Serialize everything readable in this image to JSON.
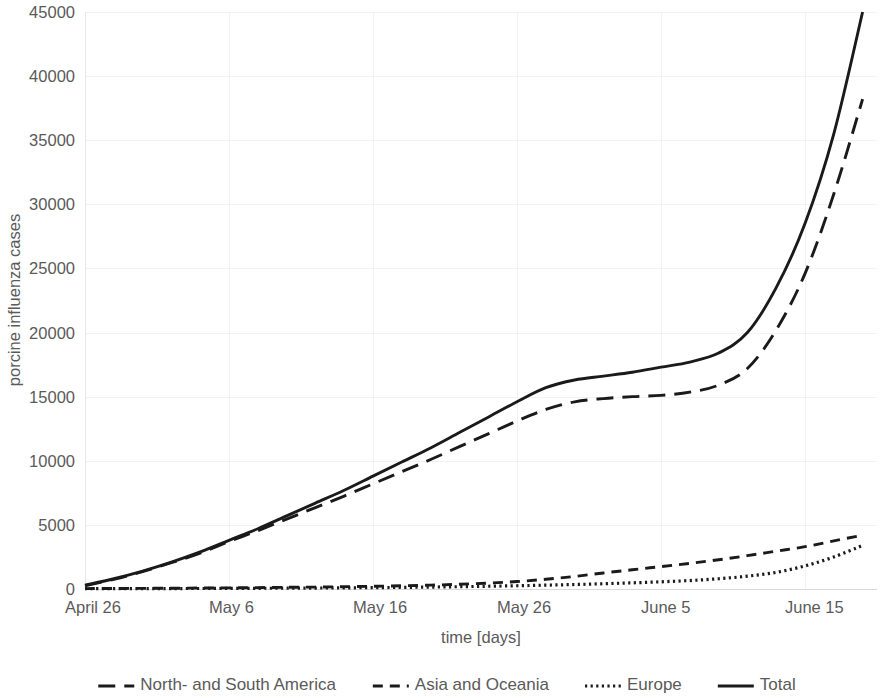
{
  "chart_data": {
    "type": "line",
    "title": "",
    "xlabel": "time [days]",
    "ylabel": "porcine influenza cases",
    "grid": true,
    "legend_position": "bottom",
    "xlim": [
      0,
      55
    ],
    "ylim": [
      0,
      45000
    ],
    "y_ticks": [
      0,
      5000,
      10000,
      15000,
      20000,
      25000,
      30000,
      35000,
      40000,
      45000
    ],
    "y_tick_labels": [
      "0",
      "5000",
      "10000",
      "15000",
      "20000",
      "25000",
      "30000",
      "35000",
      "40000",
      "45000"
    ],
    "x_ticks": [
      0,
      10,
      20,
      30,
      40,
      50
    ],
    "x_tick_labels": [
      "April 26",
      "May 6",
      "May 16",
      "May 26",
      "June 5",
      "June 15"
    ],
    "x": [
      0,
      2,
      4,
      6,
      8,
      10,
      12,
      14,
      16,
      18,
      20,
      22,
      24,
      26,
      28,
      30,
      32,
      34,
      36,
      38,
      40,
      42,
      44,
      46,
      48,
      50,
      52,
      54
    ],
    "series": [
      {
        "name": "Total",
        "style": "solid",
        "color": "#1a1a1a",
        "values": [
          300,
          800,
          1400,
          2100,
          2900,
          3800,
          4700,
          5700,
          6700,
          7700,
          8800,
          9900,
          11000,
          12200,
          13400,
          14600,
          15700,
          16300,
          16600,
          16900,
          17300,
          17700,
          18400,
          20000,
          23500,
          28500,
          35500,
          45000
        ]
      },
      {
        "name": "North- and South America",
        "style": "long-dash",
        "color": "#1a1a1a",
        "values": [
          250,
          750,
          1350,
          2050,
          2800,
          3700,
          4550,
          5450,
          6350,
          7250,
          8200,
          9150,
          10100,
          11100,
          12100,
          13100,
          14000,
          14600,
          14850,
          15000,
          15100,
          15350,
          15900,
          17200,
          20200,
          24600,
          30800,
          38200
        ]
      },
      {
        "name": "Asia and Oceania",
        "style": "short-dash",
        "color": "#1a1a1a",
        "values": [
          30,
          40,
          50,
          60,
          75,
          90,
          110,
          130,
          150,
          180,
          210,
          250,
          300,
          370,
          460,
          580,
          760,
          980,
          1250,
          1500,
          1750,
          2000,
          2280,
          2600,
          2950,
          3300,
          3750,
          4200
        ]
      },
      {
        "name": "Europe",
        "style": "dotted",
        "color": "#1a1a1a",
        "values": [
          20,
          25,
          30,
          35,
          40,
          45,
          55,
          65,
          75,
          90,
          105,
          125,
          150,
          180,
          215,
          255,
          300,
          350,
          410,
          480,
          560,
          660,
          800,
          1000,
          1300,
          1800,
          2500,
          3400
        ]
      }
    ],
    "legend": [
      {
        "label": "North- and South America",
        "style": "long-dash"
      },
      {
        "label": "Asia and Oceania",
        "style": "short-dash"
      },
      {
        "label": "Europe",
        "style": "dotted"
      },
      {
        "label": "Total",
        "style": "solid"
      }
    ]
  },
  "layout": {
    "plot_left": 85,
    "plot_right": 877,
    "plot_top": 12,
    "plot_bottom": 589
  }
}
